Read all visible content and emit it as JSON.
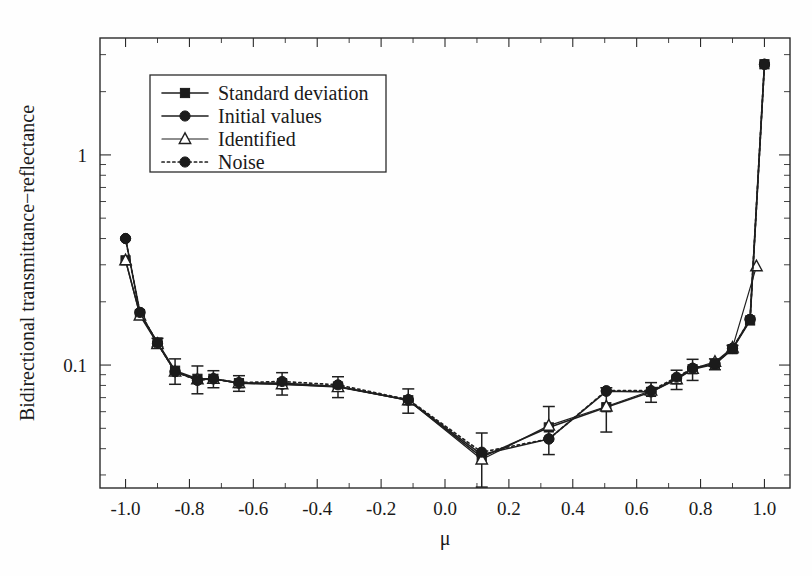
{
  "chart_data": {
    "type": "line",
    "title": "",
    "xlabel": "μ",
    "ylabel": "Bidirectional transmittance−reflectance",
    "xlim": [
      -1.08,
      1.08
    ],
    "ylim": [
      0.026,
      3.6
    ],
    "yscale": "log",
    "xscale": "linear",
    "grid": false,
    "legend_position": "upper-left",
    "xticks": [
      "-1.0",
      "-0.8",
      "-0.6",
      "-0.4",
      "-0.2",
      "0.0",
      "0.2",
      "0.4",
      "0.6",
      "0.8",
      "1.0"
    ],
    "xtick_values": [
      -1.0,
      -0.8,
      -0.6,
      -0.4,
      -0.2,
      0.0,
      0.2,
      0.4,
      0.6,
      0.8,
      1.0
    ],
    "yticks": [
      "1",
      "0.1"
    ],
    "ytick_values": [
      1,
      0.1
    ],
    "series": [
      {
        "name": "Standard deviation",
        "marker": "square",
        "linestyle": "solid",
        "x": [
          -1.0,
          -0.955,
          -0.9,
          -0.845,
          -0.775,
          -0.725,
          -0.645,
          -0.51,
          -0.335,
          -0.115,
          0.115,
          0.325,
          0.505,
          0.645,
          0.725,
          0.775,
          0.845,
          0.9,
          0.955,
          1.0
        ],
        "values": [
          0.315,
          0.175,
          0.128,
          0.094,
          0.086,
          0.086,
          0.082,
          0.082,
          0.079,
          0.068,
          0.0365,
          0.0505,
          0.063,
          0.0745,
          0.0855,
          0.0955,
          0.101,
          0.119,
          0.163,
          2.7
        ],
        "errors": [
          0.0,
          0.0,
          0.006,
          0.013,
          0.013,
          0.008,
          0.007,
          0.01,
          0.009,
          0.009,
          0.011,
          0.013,
          0.015,
          0.008,
          0.009,
          0.011,
          0.006,
          0.005,
          0.0,
          0.0
        ]
      },
      {
        "name": "Initial values",
        "marker": "circle",
        "linestyle": "solid",
        "x": [
          -1.0,
          -0.955,
          -0.9,
          -0.845,
          -0.775,
          -0.725,
          -0.645,
          -0.51,
          -0.335,
          -0.115,
          0.115,
          0.325,
          0.505,
          0.645,
          0.725,
          0.775,
          0.845,
          0.9,
          0.955,
          1.0
        ],
        "values": [
          0.4,
          0.178,
          0.127,
          0.093,
          0.085,
          0.086,
          0.082,
          0.081,
          0.079,
          0.068,
          0.0375,
          0.0445,
          0.075,
          0.0745,
          0.0865,
          0.0965,
          0.1015,
          0.12,
          0.165,
          2.7
        ]
      },
      {
        "name": "Identified",
        "marker": "triangle",
        "linestyle": "solid",
        "x": [
          -1.0,
          -0.955,
          -0.9,
          -0.845,
          -0.775,
          -0.725,
          -0.645,
          -0.51,
          -0.335,
          -0.115,
          0.115,
          0.325,
          0.505,
          0.645,
          0.725,
          0.775,
          0.845,
          0.9,
          0.975
        ],
        "values": [
          0.315,
          0.172,
          0.126,
          0.093,
          0.0855,
          0.086,
          0.082,
          0.081,
          0.0785,
          0.068,
          0.0355,
          0.0515,
          0.0635,
          0.0755,
          0.0855,
          0.096,
          0.1035,
          0.121,
          0.295
        ]
      },
      {
        "name": "Noise",
        "marker": "circle",
        "linestyle": "dotted",
        "x": [
          -1.0,
          -0.955,
          -0.9,
          -0.845,
          -0.775,
          -0.725,
          -0.645,
          -0.51,
          -0.335,
          -0.115,
          0.115,
          0.325,
          0.505,
          0.645,
          0.725,
          0.775,
          0.845,
          0.9,
          0.955,
          1.0
        ],
        "values": [
          0.4,
          0.178,
          0.127,
          0.093,
          0.0845,
          0.086,
          0.0825,
          0.0835,
          0.0805,
          0.0685,
          0.0385,
          0.0445,
          0.0755,
          0.0755,
          0.0875,
          0.0965,
          0.1015,
          0.12,
          0.165,
          2.7
        ]
      }
    ]
  },
  "legend": {
    "entries": [
      {
        "label": "Standard deviation",
        "marker": "square",
        "linestyle": "solid"
      },
      {
        "label": "Initial values",
        "marker": "circle",
        "linestyle": "solid"
      },
      {
        "label": "Identified",
        "marker": "triangle",
        "linestyle": "solid"
      },
      {
        "label": "Noise",
        "marker": "circle",
        "linestyle": "dotted"
      }
    ]
  },
  "colors": {
    "foreground": "#1a1a1a",
    "axis": "#2b2b2b",
    "background": "#fefefe",
    "marker_fill": "#1b1b1b",
    "marker_open": "#ffffff"
  }
}
